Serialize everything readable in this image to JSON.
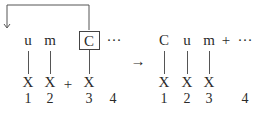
{
  "diagram": {
    "left": {
      "top_row": [
        "u",
        "m",
        "C",
        "···"
      ],
      "boxed_item": "C",
      "x_row": [
        "X",
        "X",
        "+",
        "X"
      ],
      "numbers": [
        "1",
        "2",
        "3",
        "4"
      ]
    },
    "arrow": "→",
    "right": {
      "top_row": [
        "C",
        "u",
        "m",
        "+",
        "···"
      ],
      "x_row": [
        "X",
        "X",
        "X"
      ],
      "numbers": [
        "1",
        "2",
        "3",
        "4"
      ]
    },
    "colors": {
      "ink": "#2a2a2a",
      "lines": "#555555"
    }
  }
}
